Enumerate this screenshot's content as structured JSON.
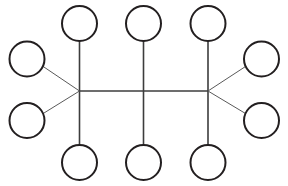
{
  "canvas": {
    "width": 288,
    "height": 186,
    "background_color": "#ffffff",
    "title": "Node-link network diagram"
  },
  "style": {
    "node_stroke_color": "#231f20",
    "node_fill_color": "#ffffff",
    "node_stroke_width": 2,
    "node_radius": 17.5,
    "edge_color": "#5a5a5a",
    "edge_color_dark": "#3d3d3d",
    "edge_width_spoke": 1,
    "edge_width_trunk": 1.6
  },
  "graph": {
    "node_count": 12,
    "edge_count": 12,
    "hub_count": 2,
    "shape": "double-star / barbell with central pendant",
    "hubs": [
      {
        "id": "hub-left",
        "label": "",
        "cx": 79.5,
        "cy": 91
      },
      {
        "id": "hub-right",
        "label": "",
        "cx": 208,
        "cy": 91
      }
    ],
    "nodes": [
      {
        "id": "node-top-left",
        "label": "",
        "cx": 79.5,
        "cy": 23.5,
        "r": 17.5,
        "group": "top"
      },
      {
        "id": "node-top-middle",
        "label": "",
        "cx": 143.5,
        "cy": 23.5,
        "r": 17.5,
        "group": "top"
      },
      {
        "id": "node-top-right",
        "label": "",
        "cx": 208,
        "cy": 23.5,
        "r": 17.5,
        "group": "top"
      },
      {
        "id": "node-bottom-left",
        "label": "",
        "cx": 79.5,
        "cy": 162.5,
        "r": 17.5,
        "group": "bottom"
      },
      {
        "id": "node-bottom-middle",
        "label": "",
        "cx": 143.5,
        "cy": 162.5,
        "r": 17.5,
        "group": "bottom"
      },
      {
        "id": "node-bottom-right",
        "label": "",
        "cx": 208,
        "cy": 162.5,
        "r": 17.5,
        "group": "bottom"
      },
      {
        "id": "node-left-upper",
        "label": "",
        "cx": 27,
        "cy": 59,
        "r": 17.5,
        "group": "left"
      },
      {
        "id": "node-left-lower",
        "label": "",
        "cx": 27,
        "cy": 120.5,
        "r": 17.5,
        "group": "left"
      },
      {
        "id": "node-right-upper",
        "label": "",
        "cx": 261.5,
        "cy": 59,
        "r": 17.5,
        "group": "right"
      },
      {
        "id": "node-right-lower",
        "label": "",
        "cx": 261.5,
        "cy": 120.5,
        "r": 17.5,
        "group": "right"
      },
      {
        "id": "node-center-top-anchor",
        "label": "",
        "cx": 143.5,
        "cy": 23.5,
        "r": 17.5,
        "group": "center",
        "alias_of": "node-top-middle"
      },
      {
        "id": "node-center-bottom-anchor",
        "label": "",
        "cx": 143.5,
        "cy": 162.5,
        "r": 17.5,
        "group": "center",
        "alias_of": "node-bottom-middle"
      }
    ],
    "edges": [
      {
        "id": "edge-hubleft-topleft",
        "from": "hub-left",
        "to": "node-top-left",
        "x1": 79.5,
        "y1": 91,
        "x2": 79.5,
        "y2": 41,
        "weight": "trunk"
      },
      {
        "id": "edge-hubleft-bottomleft",
        "from": "hub-left",
        "to": "node-bottom-left",
        "x1": 79.5,
        "y1": 91,
        "x2": 79.5,
        "y2": 145,
        "weight": "trunk"
      },
      {
        "id": "edge-hubleft-leftupper",
        "from": "hub-left",
        "to": "node-left-upper",
        "x1": 79.5,
        "y1": 91,
        "x2": 43.2,
        "y2": 66.5,
        "weight": "spoke"
      },
      {
        "id": "edge-hubleft-leftlower",
        "from": "hub-left",
        "to": "node-left-lower",
        "x1": 79.5,
        "y1": 91,
        "x2": 43.2,
        "y2": 113.5,
        "weight": "spoke"
      },
      {
        "id": "edge-hubleft-hubright",
        "from": "hub-left",
        "to": "hub-right",
        "x1": 79.5,
        "y1": 91,
        "x2": 208,
        "y2": 91,
        "weight": "trunk"
      },
      {
        "id": "edge-hubright-topright",
        "from": "hub-right",
        "to": "node-top-right",
        "x1": 208,
        "y1": 91,
        "x2": 208,
        "y2": 41,
        "weight": "trunk"
      },
      {
        "id": "edge-hubright-bottomright",
        "from": "hub-right",
        "to": "node-bottom-right",
        "x1": 208,
        "y1": 91,
        "x2": 208,
        "y2": 145,
        "weight": "trunk"
      },
      {
        "id": "edge-hubright-rightupper",
        "from": "hub-right",
        "to": "node-right-upper",
        "x1": 208,
        "y1": 91,
        "x2": 245.5,
        "y2": 66.5,
        "weight": "spoke"
      },
      {
        "id": "edge-hubright-rightlower",
        "from": "hub-right",
        "to": "node-right-lower",
        "x1": 208,
        "y1": 91,
        "x2": 245.5,
        "y2": 113.5,
        "weight": "spoke"
      },
      {
        "id": "edge-center-topmiddle",
        "from": "trunk-midpoint",
        "to": "node-top-middle",
        "x1": 143.5,
        "y1": 91,
        "x2": 143.5,
        "y2": 41,
        "weight": "trunk"
      },
      {
        "id": "edge-center-bottommiddle",
        "from": "trunk-midpoint",
        "to": "node-bottom-middle",
        "x1": 143.5,
        "y1": 91,
        "x2": 143.5,
        "y2": 145,
        "weight": "trunk"
      }
    ]
  }
}
